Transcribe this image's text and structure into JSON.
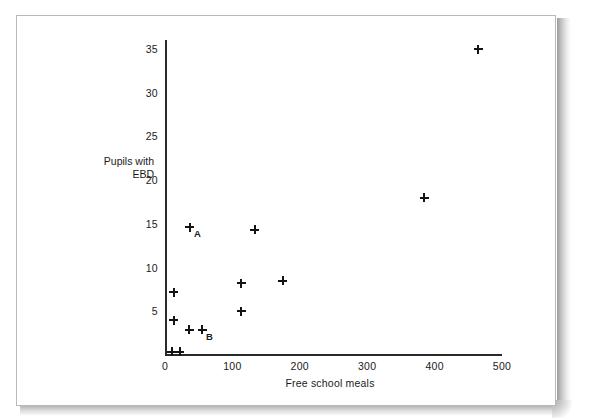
{
  "chart_data": {
    "type": "scatter",
    "title": "",
    "xlabel": "Free school meals",
    "ylabel": "Pupils with\nEBD",
    "ylabel_line1": "Pupils with",
    "ylabel_line2": "EBD",
    "xlim": [
      0,
      500
    ],
    "ylim": [
      0,
      36
    ],
    "xticks": [
      0,
      100,
      200,
      300,
      400,
      500
    ],
    "xtick_labels": [
      "0",
      "100",
      "200",
      "300",
      "400",
      "500"
    ],
    "yticks": [
      5,
      10,
      15,
      20,
      25,
      30,
      35
    ],
    "ytick_labels": [
      "5",
      "10",
      "15",
      "20",
      "25",
      "30",
      "35"
    ],
    "grid": false,
    "legend": "none",
    "marker": "plus",
    "marker_color": "#141414",
    "points": [
      {
        "x": 10,
        "y": 0.4,
        "label": ""
      },
      {
        "x": 22,
        "y": 0.4,
        "label": ""
      },
      {
        "x": 13,
        "y": 4.0,
        "label": ""
      },
      {
        "x": 13,
        "y": 7.2,
        "label": ""
      },
      {
        "x": 36,
        "y": 2.9,
        "label": ""
      },
      {
        "x": 55,
        "y": 2.9,
        "label": "B"
      },
      {
        "x": 37,
        "y": 14.6,
        "label": "A"
      },
      {
        "x": 113,
        "y": 5.0,
        "label": ""
      },
      {
        "x": 113,
        "y": 8.2,
        "label": ""
      },
      {
        "x": 133,
        "y": 14.3,
        "label": ""
      },
      {
        "x": 175,
        "y": 8.5,
        "label": ""
      },
      {
        "x": 385,
        "y": 18.0,
        "label": ""
      },
      {
        "x": 465,
        "y": 35.0,
        "label": ""
      }
    ],
    "annotations": [
      {
        "text": "A",
        "x": 37,
        "y": 14.6
      },
      {
        "text": "B",
        "x": 55,
        "y": 2.9
      }
    ]
  },
  "page": {
    "background_color": "#ffffff",
    "sheet_border_color": "#b9b9b9",
    "axis_color": "#2a2a2a"
  }
}
